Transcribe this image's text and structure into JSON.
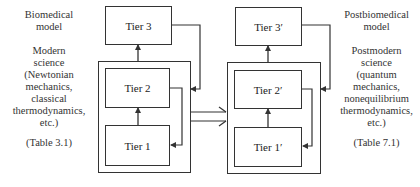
{
  "left": {
    "model_title": [
      "Biomedical",
      "model"
    ],
    "science_description": [
      "Modern",
      "science",
      "(Newtonian",
      "mechanics,",
      "classical",
      "thermodynamics,",
      "etc.)"
    ],
    "table_ref": "(Table 3.1)",
    "tiers": {
      "tier3": "Tier 3",
      "tier2": "Tier 2",
      "tier1": "Tier 1"
    }
  },
  "right": {
    "model_title": [
      "Postbiomedical",
      "model"
    ],
    "science_description": [
      "Postmodern",
      "science",
      "(quantum",
      "mechanics,",
      "nonequilibrium",
      "thermodynamics,",
      "etc.)"
    ],
    "table_ref": "(Table 7.1)",
    "tiers": {
      "tier3": "Tier 3′",
      "tier2": "Tier 2′",
      "tier1": "Tier 1′"
    }
  },
  "transition_arrow": "double-line-open-arrow",
  "colors": {
    "line": "#333333",
    "background": "#ffffff",
    "text": "#222222"
  }
}
